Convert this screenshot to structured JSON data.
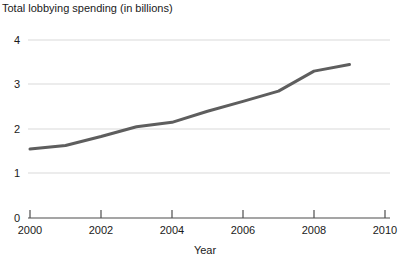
{
  "chart_data": {
    "type": "line",
    "title": "Total lobbying spending (in billions)",
    "xlabel": "Year",
    "ylabel": "",
    "x": [
      2000,
      2001,
      2002,
      2003,
      2004,
      2005,
      2006,
      2007,
      2008,
      2009
    ],
    "values": [
      1.55,
      1.63,
      1.83,
      2.05,
      2.15,
      2.4,
      2.62,
      2.85,
      3.3,
      3.45
    ],
    "series": [
      {
        "name": "Total lobbying spending",
        "values": [
          1.55,
          1.63,
          1.83,
          2.05,
          2.15,
          2.4,
          2.62,
          2.85,
          3.3,
          3.45
        ]
      }
    ],
    "xlim": [
      2000,
      2010
    ],
    "ylim": [
      0,
      4
    ],
    "xticks": [
      2000,
      2002,
      2004,
      2006,
      2008,
      2010
    ],
    "xtick_labels": [
      "2000",
      "2002",
      "2004",
      "2006",
      "2008",
      "2010"
    ],
    "yticks": [
      0,
      1,
      2,
      3,
      4
    ],
    "ytick_labels": [
      "0",
      "1",
      "2",
      "3",
      "4"
    ],
    "grid": "horizontal",
    "legend": "none",
    "line_color": "#5e5e5e",
    "grid_color": "#d9d9d9",
    "axis_color": "#4d4d4d",
    "background_color": "#ffffff"
  }
}
